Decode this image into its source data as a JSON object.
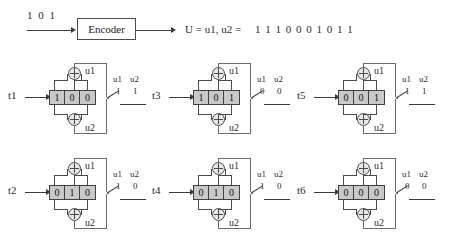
{
  "header": {
    "input_bits": "1 0 1",
    "encoder_label": "Encoder",
    "output_expression": "U = u1, u2 =",
    "output_bits": "1 1    1 0    0 0    1 0    1 1"
  },
  "legend": {
    "u1_label": "u1",
    "u2_label": "u2"
  },
  "stages": [
    {
      "time_label": "t1",
      "registers": [
        "1",
        "0",
        "0"
      ],
      "u1_label": "u1",
      "u2_label": "u2",
      "u1_value": "1",
      "u2_value": "1"
    },
    {
      "time_label": "t3",
      "registers": [
        "1",
        "0",
        "1"
      ],
      "u1_label": "u1",
      "u2_label": "u2",
      "u1_value": "0",
      "u2_value": "0"
    },
    {
      "time_label": "t5",
      "registers": [
        "0",
        "0",
        "1"
      ],
      "u1_label": "u1",
      "u2_label": "u2",
      "u1_value": "1",
      "u2_value": "1"
    },
    {
      "time_label": "t2",
      "registers": [
        "0",
        "1",
        "0"
      ],
      "u1_label": "u1",
      "u2_label": "u2",
      "u1_value": "1",
      "u2_value": "0"
    },
    {
      "time_label": "t4",
      "registers": [
        "0",
        "1",
        "0"
      ],
      "u1_label": "u1",
      "u2_label": "u2",
      "u1_value": "1",
      "u2_value": "0"
    },
    {
      "time_label": "t6",
      "registers": [
        "0",
        "0",
        "0"
      ],
      "u1_label": "u1",
      "u2_label": "u2",
      "u1_value": "0",
      "u2_value": "0"
    }
  ],
  "colors": {
    "register_fill": "#c9c9c9",
    "line": "#3a3a3a",
    "frame": "#6b6b6b"
  }
}
